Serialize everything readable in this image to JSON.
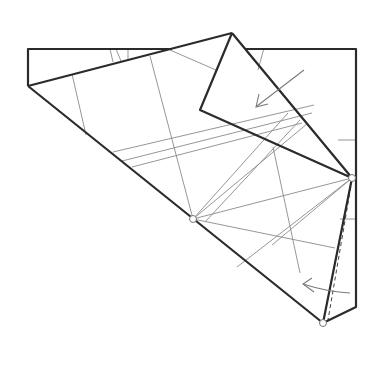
{
  "diagram": {
    "type": "origami-folding-step",
    "colors": {
      "thick_line": "#2b2b2b",
      "thin_line": "#8a8a8a",
      "background": "#ffffff"
    },
    "reference_points": [
      {
        "name": "left-crease-point",
        "x": 193,
        "y": 219
      },
      {
        "name": "right-corner-point",
        "x": 352,
        "y": 178
      },
      {
        "name": "bottom-corner-point",
        "x": 323,
        "y": 323
      }
    ],
    "arrows": [
      {
        "name": "fold-down-left-arrow",
        "from": [
          304,
          70
        ],
        "to": [
          256,
          107
        ]
      },
      {
        "name": "fold-left-arrow",
        "from": [
          350,
          293
        ],
        "to": [
          303,
          284
        ]
      }
    ]
  }
}
